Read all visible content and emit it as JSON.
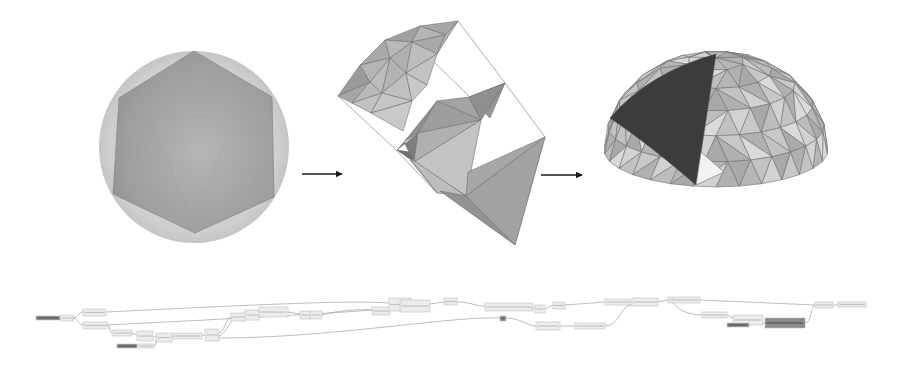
{
  "figure": {
    "stages": [
      {
        "id": "icosahedron",
        "description": "icosahedron inscribed in circle (top view)"
      },
      {
        "id": "partial-subdivision",
        "description": "partially subdivided geodesic strip"
      },
      {
        "id": "geodesic-dome",
        "description": "completed geodesic hemisphere dome with one highlighted face"
      }
    ],
    "arrows": [
      {
        "from": "icosahedron",
        "to": "partial-subdivision"
      },
      {
        "from": "partial-subdivision",
        "to": "geodesic-dome"
      }
    ]
  },
  "colors": {
    "background": "#ffffff",
    "circle_fill": "#c9c9c9",
    "hexagon_fill": "#a3a3a3",
    "face_light": "#c4c4c4",
    "face_mid": "#a8a8a8",
    "face_dark": "#8e8e8e",
    "highlight_face": "#3c3c3c",
    "edge": "#6e6e6e",
    "arrow": "#1a1a1a",
    "node_fill": "#ececec",
    "node_border": "#b5b5b5",
    "wire": "#a0a0a0"
  },
  "node_graph": {
    "description": "visual programming node graph (labels illegible)",
    "nodes": [
      {
        "x": 36,
        "y": 316,
        "w": 24,
        "h": 4,
        "dark": true
      },
      {
        "x": 61,
        "y": 315,
        "w": 12,
        "h": 6
      },
      {
        "x": 83,
        "y": 309,
        "w": 23,
        "h": 7
      },
      {
        "x": 83,
        "y": 322,
        "w": 24,
        "h": 7
      },
      {
        "x": 112,
        "y": 330,
        "w": 20,
        "h": 6
      },
      {
        "x": 137,
        "y": 331,
        "w": 16,
        "h": 10
      },
      {
        "x": 117,
        "y": 344,
        "w": 20,
        "h": 4,
        "dark": true
      },
      {
        "x": 138,
        "y": 344,
        "w": 16,
        "h": 4
      },
      {
        "x": 156,
        "y": 333,
        "w": 16,
        "h": 9
      },
      {
        "x": 173,
        "y": 333,
        "w": 29,
        "h": 6
      },
      {
        "x": 205,
        "y": 329,
        "w": 14,
        "h": 12
      },
      {
        "x": 231,
        "y": 313,
        "w": 15,
        "h": 8
      },
      {
        "x": 245,
        "y": 310,
        "w": 14,
        "h": 10
      },
      {
        "x": 259,
        "y": 307,
        "w": 29,
        "h": 10
      },
      {
        "x": 300,
        "y": 311,
        "w": 11,
        "h": 8
      },
      {
        "x": 310,
        "y": 311,
        "w": 12,
        "h": 8
      },
      {
        "x": 372,
        "y": 307,
        "w": 18,
        "h": 8
      },
      {
        "x": 389,
        "y": 298,
        "w": 22,
        "h": 13
      },
      {
        "x": 400,
        "y": 300,
        "w": 30,
        "h": 12
      },
      {
        "x": 444,
        "y": 298,
        "w": 13,
        "h": 7
      },
      {
        "x": 485,
        "y": 303,
        "w": 48,
        "h": 8
      },
      {
        "x": 535,
        "y": 305,
        "w": 10,
        "h": 8
      },
      {
        "x": 553,
        "y": 302,
        "w": 12,
        "h": 7
      },
      {
        "x": 500,
        "y": 316,
        "w": 6,
        "h": 5,
        "dark": true
      },
      {
        "x": 536,
        "y": 322,
        "w": 24,
        "h": 8
      },
      {
        "x": 575,
        "y": 323,
        "w": 30,
        "h": 6
      },
      {
        "x": 605,
        "y": 299,
        "w": 25,
        "h": 6
      },
      {
        "x": 632,
        "y": 298,
        "w": 26,
        "h": 8
      },
      {
        "x": 668,
        "y": 297,
        "w": 32,
        "h": 6
      },
      {
        "x": 702,
        "y": 312,
        "w": 25,
        "h": 6
      },
      {
        "x": 733,
        "y": 315,
        "w": 30,
        "h": 10
      },
      {
        "x": 727,
        "y": 323,
        "w": 22,
        "h": 4,
        "dark": true
      },
      {
        "x": 765,
        "y": 318,
        "w": 40,
        "h": 10,
        "dark": true
      },
      {
        "x": 815,
        "y": 302,
        "w": 18,
        "h": 6
      },
      {
        "x": 838,
        "y": 302,
        "w": 28,
        "h": 5
      }
    ]
  }
}
